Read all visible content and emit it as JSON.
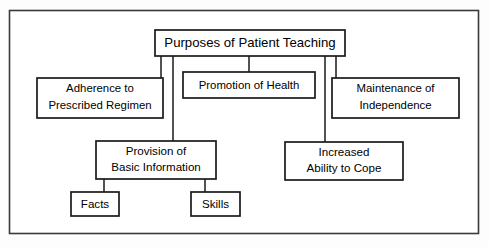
{
  "diagram": {
    "title": "Purposes of Patient Teaching",
    "type": "hierarchy-flowchart",
    "frame": {
      "visible": true,
      "color": "#3a3a3a"
    },
    "nodes": {
      "root": {
        "label": "Purposes of Patient Teaching",
        "lines": [
          "Purposes of Patient Teaching"
        ],
        "x": 155,
        "y": 30,
        "w": 190,
        "h": 26
      },
      "adherence": {
        "label": "Adherence to Prescribed Regimen",
        "lines": [
          "Adherence to",
          "Prescribed Regimen"
        ],
        "x": 37,
        "y": 78,
        "w": 126,
        "h": 40
      },
      "promotion": {
        "label": "Promotion of Health",
        "lines": [
          "Promotion of Health"
        ],
        "x": 183,
        "y": 72,
        "w": 132,
        "h": 26
      },
      "maintenance": {
        "label": "Maintenance of Independence",
        "lines": [
          "Maintenance of",
          "Independence"
        ],
        "x": 332,
        "y": 78,
        "w": 127,
        "h": 40
      },
      "provision": {
        "label": "Provision of Basic Information",
        "lines": [
          "Provision of",
          "Basic Information"
        ],
        "x": 96,
        "y": 141,
        "w": 120,
        "h": 38
      },
      "increased": {
        "label": "Increased Ability to Cope",
        "lines": [
          "Increased",
          "Ability to Cope"
        ],
        "x": 285,
        "y": 142,
        "w": 118,
        "h": 38
      },
      "facts": {
        "label": "Facts",
        "lines": [
          "Facts"
        ],
        "x": 71,
        "y": 192,
        "w": 48,
        "h": 24
      },
      "skills": {
        "label": "Skills",
        "lines": [
          "Skills"
        ],
        "x": 191,
        "y": 192,
        "w": 49,
        "h": 24
      }
    },
    "edges": [
      {
        "from": "root",
        "to": "adherence",
        "path": "M161,56 L161,78"
      },
      {
        "from": "root",
        "to": "provision",
        "path": "M173,56 L173,141"
      },
      {
        "from": "root",
        "to": "promotion",
        "path": "M249,56 L249,72"
      },
      {
        "from": "root",
        "to": "increased",
        "path": "M325,56 L325,142"
      },
      {
        "from": "root",
        "to": "maintenance",
        "path": "M336,56 L336,78"
      },
      {
        "from": "provision",
        "to": "facts",
        "path": "M104,179 L104,192"
      },
      {
        "from": "provision",
        "to": "skills",
        "path": "M205,179 L205,192"
      }
    ]
  }
}
